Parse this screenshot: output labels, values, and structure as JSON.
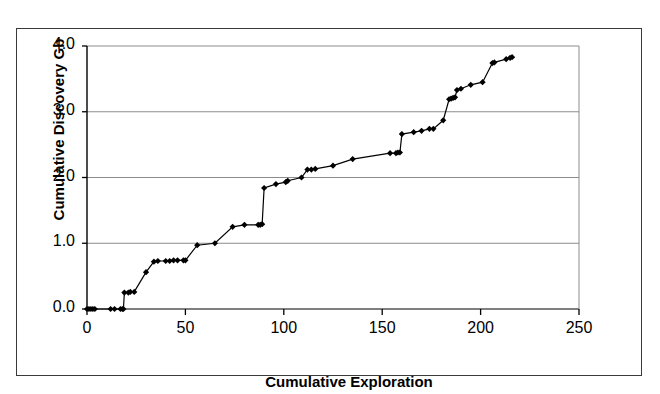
{
  "chart_data": {
    "type": "line",
    "title": "",
    "subtitle": "",
    "xlabel": "Cumulative Exploration",
    "ylabel": "Cumulative Discovery Gb",
    "xlim": [
      0,
      250
    ],
    "ylim": [
      0,
      4.0
    ],
    "xticks": [
      0,
      50,
      100,
      150,
      200,
      250
    ],
    "xtick_labels": [
      "0",
      "50",
      "100",
      "150",
      "200",
      "250"
    ],
    "yticks": [
      0.0,
      1.0,
      2.0,
      3.0,
      4.0
    ],
    "ytick_labels": [
      "0.0",
      "1.0",
      "2.0",
      "3.0",
      "4.0"
    ],
    "grid": "horizontal",
    "legend": "none",
    "annotations": [],
    "marker": "diamond",
    "marker_color": "#000000",
    "line_color": "#000000",
    "series": [
      {
        "name": "Cumulative Discovery",
        "x": [
          0,
          1,
          2,
          3,
          4,
          12,
          14,
          17,
          18,
          18.5,
          19,
          21,
          22,
          24,
          30,
          34,
          36,
          40,
          42,
          44,
          46,
          49,
          50,
          56,
          65,
          74,
          80,
          87,
          88,
          89,
          90,
          96,
          101,
          102,
          109,
          112,
          114,
          116,
          125,
          135,
          154,
          157,
          158,
          159,
          160,
          166,
          170,
          174,
          176,
          181,
          184,
          185,
          186,
          187,
          188,
          190,
          195,
          201,
          206,
          207,
          213,
          215,
          216
        ],
        "y": [
          0.0,
          0.0,
          0.0,
          0.0,
          0.0,
          0.0,
          0.0,
          0.0,
          0.0,
          0.0,
          0.25,
          0.25,
          0.26,
          0.26,
          0.56,
          0.72,
          0.73,
          0.73,
          0.73,
          0.74,
          0.74,
          0.74,
          0.74,
          0.97,
          1.0,
          1.25,
          1.28,
          1.28,
          1.28,
          1.29,
          1.84,
          1.9,
          1.93,
          1.95,
          2.0,
          2.12,
          2.12,
          2.13,
          2.18,
          2.28,
          2.37,
          2.37,
          2.38,
          2.38,
          2.66,
          2.69,
          2.71,
          2.74,
          2.74,
          2.87,
          3.19,
          3.2,
          3.21,
          3.22,
          3.33,
          3.35,
          3.41,
          3.45,
          3.74,
          3.75,
          3.8,
          3.82,
          3.83
        ]
      }
    ]
  }
}
